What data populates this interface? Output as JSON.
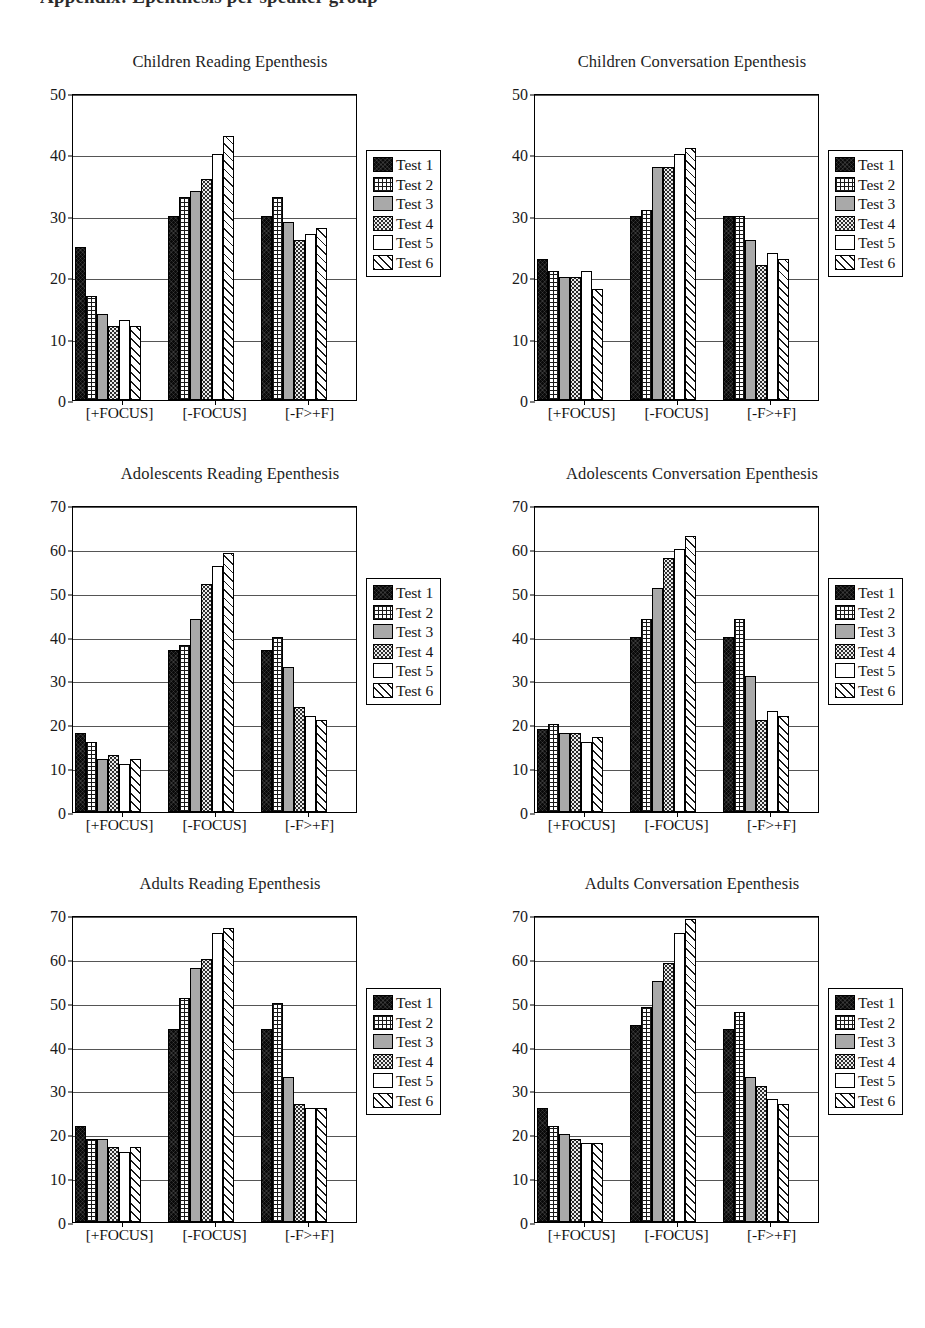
{
  "page": {
    "header_clipped_text": "Appendix: Epenthesis per speaker group"
  },
  "legend": {
    "items": [
      {
        "label": "Test 1",
        "pattern": "solid-black"
      },
      {
        "label": "Test 2",
        "pattern": "crosshatch"
      },
      {
        "label": "Test 3",
        "pattern": "solid-gray"
      },
      {
        "label": "Test 4",
        "pattern": "dotted"
      },
      {
        "label": "Test 5",
        "pattern": "white"
      },
      {
        "label": "Test 6",
        "pattern": "diagonal-hatch"
      }
    ]
  },
  "chart_data": [
    {
      "type": "bar",
      "title": "Children Reading Epenthesis",
      "xlabel": "",
      "ylabel": "",
      "ylim": [
        0,
        50
      ],
      "yticks": [
        0,
        10,
        20,
        30,
        40,
        50
      ],
      "grid": true,
      "legend_position": "right",
      "categories": [
        "[+FOCUS]",
        "[-FOCUS]",
        "[-F>+F]"
      ],
      "series": [
        {
          "name": "Test 1",
          "values": [
            25,
            30,
            30
          ]
        },
        {
          "name": "Test 2",
          "values": [
            17,
            33,
            33
          ]
        },
        {
          "name": "Test 3",
          "values": [
            14,
            34,
            29
          ]
        },
        {
          "name": "Test 4",
          "values": [
            12,
            36,
            26
          ]
        },
        {
          "name": "Test 5",
          "values": [
            13,
            40,
            27
          ]
        },
        {
          "name": "Test 6",
          "values": [
            12,
            43,
            28
          ]
        }
      ]
    },
    {
      "type": "bar",
      "title": "Children Conversation Epenthesis",
      "xlabel": "",
      "ylabel": "",
      "ylim": [
        0,
        50
      ],
      "yticks": [
        0,
        10,
        20,
        30,
        40,
        50
      ],
      "grid": true,
      "legend_position": "right",
      "categories": [
        "[+FOCUS]",
        "[-FOCUS]",
        "[-F>+F]"
      ],
      "series": [
        {
          "name": "Test 1",
          "values": [
            23,
            30,
            30
          ]
        },
        {
          "name": "Test 2",
          "values": [
            21,
            31,
            30
          ]
        },
        {
          "name": "Test 3",
          "values": [
            20,
            38,
            26
          ]
        },
        {
          "name": "Test 4",
          "values": [
            20,
            38,
            22
          ]
        },
        {
          "name": "Test 5",
          "values": [
            21,
            40,
            24
          ]
        },
        {
          "name": "Test 6",
          "values": [
            18,
            41,
            23
          ]
        }
      ]
    },
    {
      "type": "bar",
      "title": "Adolescents Reading Epenthesis",
      "xlabel": "",
      "ylabel": "",
      "ylim": [
        0,
        70
      ],
      "yticks": [
        0,
        10,
        20,
        30,
        40,
        50,
        60,
        70
      ],
      "grid": true,
      "legend_position": "right",
      "categories": [
        "[+FOCUS]",
        "[-FOCUS]",
        "[-F>+F]"
      ],
      "series": [
        {
          "name": "Test 1",
          "values": [
            18,
            37,
            37
          ]
        },
        {
          "name": "Test 2",
          "values": [
            16,
            38,
            40
          ]
        },
        {
          "name": "Test 3",
          "values": [
            12,
            44,
            33
          ]
        },
        {
          "name": "Test 4",
          "values": [
            13,
            52,
            24
          ]
        },
        {
          "name": "Test 5",
          "values": [
            11,
            56,
            22
          ]
        },
        {
          "name": "Test 6",
          "values": [
            12,
            59,
            21
          ]
        }
      ]
    },
    {
      "type": "bar",
      "title": "Adolescents Conversation Epenthesis",
      "xlabel": "",
      "ylabel": "",
      "ylim": [
        0,
        70
      ],
      "yticks": [
        0,
        10,
        20,
        30,
        40,
        50,
        60,
        70
      ],
      "grid": true,
      "legend_position": "right",
      "categories": [
        "[+FOCUS]",
        "[-FOCUS]",
        "[-F>+F]"
      ],
      "series": [
        {
          "name": "Test 1",
          "values": [
            19,
            40,
            40
          ]
        },
        {
          "name": "Test 2",
          "values": [
            20,
            44,
            44
          ]
        },
        {
          "name": "Test 3",
          "values": [
            18,
            51,
            31
          ]
        },
        {
          "name": "Test 4",
          "values": [
            18,
            58,
            21
          ]
        },
        {
          "name": "Test 5",
          "values": [
            16,
            60,
            23
          ]
        },
        {
          "name": "Test 6",
          "values": [
            17,
            63,
            22
          ]
        }
      ]
    },
    {
      "type": "bar",
      "title": "Adults Reading Epenthesis",
      "xlabel": "",
      "ylabel": "",
      "ylim": [
        0,
        70
      ],
      "yticks": [
        0,
        10,
        20,
        30,
        40,
        50,
        60,
        70
      ],
      "grid": true,
      "legend_position": "right",
      "categories": [
        "[+FOCUS]",
        "[-FOCUS]",
        "[-F>+F]"
      ],
      "series": [
        {
          "name": "Test 1",
          "values": [
            22,
            44,
            44
          ]
        },
        {
          "name": "Test 2",
          "values": [
            19,
            51,
            50
          ]
        },
        {
          "name": "Test 3",
          "values": [
            19,
            58,
            33
          ]
        },
        {
          "name": "Test 4",
          "values": [
            17,
            60,
            27
          ]
        },
        {
          "name": "Test 5",
          "values": [
            16,
            66,
            26
          ]
        },
        {
          "name": "Test 6",
          "values": [
            17,
            67,
            26
          ]
        }
      ]
    },
    {
      "type": "bar",
      "title": "Adults Conversation Epenthesis",
      "xlabel": "",
      "ylabel": "",
      "ylim": [
        0,
        70
      ],
      "yticks": [
        0,
        10,
        20,
        30,
        40,
        50,
        60,
        70
      ],
      "grid": true,
      "legend_position": "right",
      "categories": [
        "[+FOCUS]",
        "[-FOCUS]",
        "[-F>+F]"
      ],
      "series": [
        {
          "name": "Test 1",
          "values": [
            26,
            45,
            44
          ]
        },
        {
          "name": "Test 2",
          "values": [
            22,
            49,
            48
          ]
        },
        {
          "name": "Test 3",
          "values": [
            20,
            55,
            33
          ]
        },
        {
          "name": "Test 4",
          "values": [
            19,
            59,
            31
          ]
        },
        {
          "name": "Test 5",
          "values": [
            18,
            66,
            28
          ]
        },
        {
          "name": "Test 6",
          "values": [
            18,
            69,
            27
          ]
        }
      ]
    }
  ]
}
